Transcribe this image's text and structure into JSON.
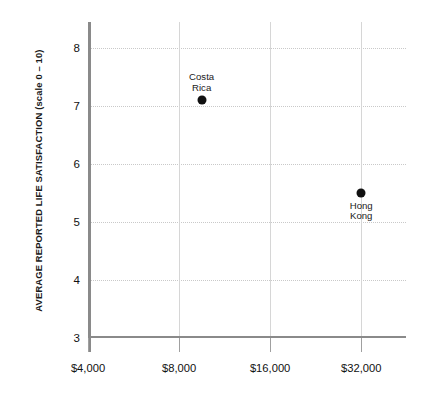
{
  "chart_data": {
    "type": "scatter",
    "title": "",
    "subtitle": "",
    "xlabel": "",
    "ylabel": "AVERAGE REPORTED LIFE SATISFACTION (scale 0 – 10)",
    "x_scale": "log",
    "x_ticks": [
      "$4,000",
      "$8,000",
      "$16,000",
      "$32,000"
    ],
    "x_tick_values": [
      4000,
      8000,
      16000,
      32000
    ],
    "xlim": [
      4000,
      45000
    ],
    "y_ticks": [
      "3",
      "4",
      "5",
      "6",
      "7",
      "8"
    ],
    "y_tick_values": [
      3,
      4,
      5,
      6,
      7,
      8
    ],
    "ylim": [
      3,
      8.45
    ],
    "grid": true,
    "legend": "none",
    "points": [
      {
        "name": "Costa Rica",
        "label": "Costa\nRica",
        "x": 9500,
        "y": 7.1,
        "label_position": "above"
      },
      {
        "name": "Hong Kong",
        "label": "Hong Kong",
        "x": 32000,
        "y": 5.5,
        "label_position": "below"
      }
    ]
  },
  "colors": {
    "point": "#111111",
    "axis": "#8a8a8a",
    "gridline": "#c9c9c9",
    "text": "#1a1a1a",
    "background": "#ffffff"
  }
}
